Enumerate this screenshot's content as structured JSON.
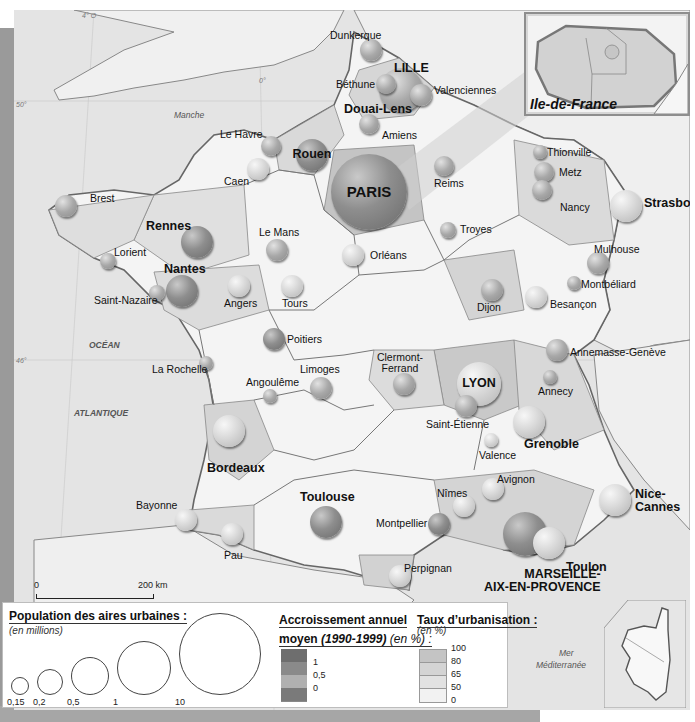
{
  "map": {
    "title": "Ile-de-France inset / France urban areas",
    "inset_idf_label": "Ile-de-France",
    "seas": [
      {
        "name": "Manche",
        "x": 160,
        "y": 100,
        "bold": false
      },
      {
        "name": "OCÉAN",
        "x": 75,
        "y": 330,
        "bold": true
      },
      {
        "name": "ATLANTIQUE",
        "x": 60,
        "y": 398,
        "bold": true
      },
      {
        "name": "Mer",
        "x": 545,
        "y": 638,
        "bold": false
      },
      {
        "name": "Méditerranée",
        "x": 522,
        "y": 650,
        "bold": false
      }
    ],
    "coordinates": [
      {
        "label": "4° O",
        "x": 68,
        "y": 2
      },
      {
        "label": "0°",
        "x": 245,
        "y": 67
      },
      {
        "label": "50°",
        "x": 2,
        "y": 91
      },
      {
        "label": "46°",
        "x": 2,
        "y": 347
      },
      {
        "label": "42°",
        "x": 600,
        "y": 640
      }
    ],
    "scale": {
      "start": "0",
      "end": "200 km"
    },
    "cities": [
      {
        "name": "PARIS",
        "x": 355,
        "y": 182,
        "r": 38,
        "tone": "dark",
        "big": true,
        "lx": 355,
        "ly": 176,
        "center": true,
        "inside": true
      },
      {
        "name": "LILLE",
        "x": 387,
        "y": 80,
        "r": 22,
        "tone": "mid",
        "big": true,
        "lx": 380,
        "ly": 52,
        "center": false
      },
      {
        "name": "Dunkerque",
        "x": 357,
        "y": 40,
        "r": 11,
        "tone": "mid",
        "big": false,
        "lx": 316,
        "ly": 20,
        "center": false
      },
      {
        "name": "Béthune",
        "x": 372,
        "y": 74,
        "r": 10,
        "tone": "mid",
        "big": false,
        "lx": 322,
        "ly": 69,
        "center": false
      },
      {
        "name": "Valenciennes",
        "x": 407,
        "y": 85,
        "r": 11,
        "tone": "mid",
        "big": false,
        "lx": 420,
        "ly": 75,
        "center": false
      },
      {
        "name": "Douai-Lens",
        "x": 365,
        "y": 90,
        "r": 0,
        "tone": "mid",
        "big": true,
        "lx": 330,
        "ly": 93,
        "center": false
      },
      {
        "name": "Amiens",
        "x": 355,
        "y": 114,
        "r": 10,
        "tone": "mid",
        "big": false,
        "lx": 368,
        "ly": 120,
        "center": false
      },
      {
        "name": "Le Havre",
        "x": 257,
        "y": 136,
        "r": 10,
        "tone": "mid",
        "big": false,
        "lx": 206,
        "ly": 119,
        "center": false
      },
      {
        "name": "Rouen",
        "x": 298,
        "y": 145,
        "r": 16,
        "tone": "dark",
        "big": true,
        "lx": 282,
        "ly": 137,
        "center": false,
        "inside": true
      },
      {
        "name": "Caen",
        "x": 244,
        "y": 159,
        "r": 11,
        "tone": "light",
        "big": false,
        "lx": 210,
        "ly": 166,
        "center": false
      },
      {
        "name": "Reims",
        "x": 430,
        "y": 156,
        "r": 10,
        "tone": "mid",
        "big": false,
        "lx": 420,
        "ly": 168,
        "center": false
      },
      {
        "name": "Thionville",
        "x": 526,
        "y": 142,
        "r": 7,
        "tone": "mid",
        "big": false,
        "lx": 533,
        "ly": 137,
        "center": false
      },
      {
        "name": "Metz",
        "x": 530,
        "y": 162,
        "r": 10,
        "tone": "mid",
        "big": false,
        "lx": 545,
        "ly": 157,
        "center": false
      },
      {
        "name": "Nancy",
        "x": 528,
        "y": 180,
        "r": 10,
        "tone": "mid",
        "big": false,
        "lx": 546,
        "ly": 192,
        "center": false
      },
      {
        "name": "Strasbourg",
        "x": 612,
        "y": 196,
        "r": 16,
        "tone": "light",
        "big": true,
        "lx": 630,
        "ly": 187,
        "center": false
      },
      {
        "name": "Brest",
        "x": 52,
        "y": 196,
        "r": 11,
        "tone": "mid",
        "big": false,
        "lx": 76,
        "ly": 183,
        "center": false
      },
      {
        "name": "Rennes",
        "x": 183,
        "y": 232,
        "r": 16,
        "tone": "dark",
        "big": true,
        "lx": 132,
        "ly": 210,
        "center": false
      },
      {
        "name": "Le Mans",
        "x": 263,
        "y": 240,
        "r": 11,
        "tone": "mid",
        "big": false,
        "lx": 245,
        "ly": 217,
        "center": false
      },
      {
        "name": "Orléans",
        "x": 339,
        "y": 245,
        "r": 11,
        "tone": "light",
        "big": false,
        "lx": 356,
        "ly": 240,
        "center": false
      },
      {
        "name": "Troyes",
        "x": 434,
        "y": 220,
        "r": 8,
        "tone": "mid",
        "big": false,
        "lx": 446,
        "ly": 214,
        "center": false
      },
      {
        "name": "Lorient",
        "x": 94,
        "y": 251,
        "r": 8,
        "tone": "mid",
        "big": false,
        "lx": 100,
        "ly": 237,
        "center": false
      },
      {
        "name": "Nantes",
        "x": 168,
        "y": 281,
        "r": 16,
        "tone": "dark",
        "big": true,
        "lx": 150,
        "ly": 253,
        "center": false
      },
      {
        "name": "Saint-Nazaire",
        "x": 143,
        "y": 283,
        "r": 8,
        "tone": "mid",
        "big": false,
        "lx": 80,
        "ly": 285,
        "center": false
      },
      {
        "name": "Angers",
        "x": 225,
        "y": 276,
        "r": 11,
        "tone": "light",
        "big": false,
        "lx": 210,
        "ly": 288,
        "center": false
      },
      {
        "name": "Tours",
        "x": 278,
        "y": 276,
        "r": 11,
        "tone": "light",
        "big": false,
        "lx": 268,
        "ly": 288,
        "center": false
      },
      {
        "name": "Mulhouse",
        "x": 584,
        "y": 253,
        "r": 11,
        "tone": "mid",
        "big": false,
        "lx": 580,
        "ly": 234,
        "center": false
      },
      {
        "name": "Montbéliard",
        "x": 560,
        "y": 273,
        "r": 7,
        "tone": "mid",
        "big": false,
        "lx": 567,
        "ly": 269,
        "center": false
      },
      {
        "name": "Dijon",
        "x": 478,
        "y": 280,
        "r": 11,
        "tone": "mid",
        "big": false,
        "lx": 463,
        "ly": 292,
        "center": false
      },
      {
        "name": "Besançon",
        "x": 522,
        "y": 287,
        "r": 11,
        "tone": "light",
        "big": false,
        "lx": 536,
        "ly": 289,
        "center": false
      },
      {
        "name": "Poitiers",
        "x": 260,
        "y": 329,
        "r": 11,
        "tone": "dark",
        "big": false,
        "lx": 273,
        "ly": 324,
        "center": false
      },
      {
        "name": "La Rochelle",
        "x": 192,
        "y": 353,
        "r": 7,
        "tone": "mid",
        "big": false,
        "lx": 138,
        "ly": 354,
        "center": false
      },
      {
        "name": "Limoges",
        "x": 307,
        "y": 378,
        "r": 11,
        "tone": "mid",
        "big": false,
        "lx": 286,
        "ly": 354,
        "center": false
      },
      {
        "name": "Angoulême",
        "x": 256,
        "y": 386,
        "r": 7,
        "tone": "mid",
        "big": false,
        "lx": 232,
        "ly": 367,
        "center": false
      },
      {
        "name": "Clermont-Ferrand",
        "x": 390,
        "y": 374,
        "r": 11,
        "tone": "mid",
        "big": false,
        "lx": 386,
        "ly": 342,
        "center": true
      },
      {
        "name": "LYON",
        "x": 465,
        "y": 374,
        "r": 22,
        "tone": "light",
        "big": true,
        "lx": 465,
        "ly": 367,
        "center": true,
        "inside": true
      },
      {
        "name": "Saint-Étienne",
        "x": 452,
        "y": 396,
        "r": 11,
        "tone": "mid",
        "big": false,
        "lx": 412,
        "ly": 409,
        "center": false
      },
      {
        "name": "Annemasse-Genève",
        "x": 543,
        "y": 340,
        "r": 11,
        "tone": "mid",
        "big": false,
        "lx": 556,
        "ly": 337,
        "center": false
      },
      {
        "name": "Annecy",
        "x": 536,
        "y": 367,
        "r": 7,
        "tone": "mid",
        "big": false,
        "lx": 524,
        "ly": 376,
        "center": false
      },
      {
        "name": "Grenoble",
        "x": 515,
        "y": 412,
        "r": 16,
        "tone": "light",
        "big": true,
        "lx": 510,
        "ly": 428,
        "center": false
      },
      {
        "name": "Valence",
        "x": 477,
        "y": 430,
        "r": 7,
        "tone": "light",
        "big": false,
        "lx": 465,
        "ly": 440,
        "center": false
      },
      {
        "name": "Bordeaux",
        "x": 215,
        "y": 421,
        "r": 16,
        "tone": "light",
        "big": true,
        "lx": 193,
        "ly": 452,
        "center": false
      },
      {
        "name": "Avignon",
        "x": 479,
        "y": 479,
        "r": 11,
        "tone": "light",
        "big": false,
        "lx": 483,
        "ly": 464,
        "center": false
      },
      {
        "name": "Nîmes",
        "x": 450,
        "y": 496,
        "r": 11,
        "tone": "light",
        "big": false,
        "lx": 423,
        "ly": 478,
        "center": false
      },
      {
        "name": "Montpellier",
        "x": 425,
        "y": 514,
        "r": 11,
        "tone": "dark",
        "big": false,
        "lx": 362,
        "ly": 508,
        "center": false
      },
      {
        "name": "Nice-Cannes",
        "x": 601,
        "y": 490,
        "r": 16,
        "tone": "light",
        "big": true,
        "lx": 621,
        "ly": 478,
        "center": false
      },
      {
        "name": "Toulouse",
        "x": 312,
        "y": 512,
        "r": 16,
        "tone": "dark",
        "big": true,
        "lx": 286,
        "ly": 481,
        "center": false
      },
      {
        "name": "Bayonne",
        "x": 172,
        "y": 510,
        "r": 11,
        "tone": "light",
        "big": false,
        "lx": 122,
        "ly": 490,
        "center": false
      },
      {
        "name": "Pau",
        "x": 218,
        "y": 524,
        "r": 11,
        "tone": "light",
        "big": false,
        "lx": 210,
        "ly": 540,
        "center": false
      },
      {
        "name": "MARSEILLE-AIX-EN-PROVENCE",
        "x": 511,
        "y": 524,
        "r": 22,
        "tone": "dark",
        "big": true,
        "lx": 470,
        "ly": 558,
        "center": false
      },
      {
        "name": "Toulon",
        "x": 535,
        "y": 533,
        "r": 16,
        "tone": "light",
        "big": true,
        "lx": 552,
        "ly": 551,
        "center": false
      },
      {
        "name": "Perpignan",
        "x": 386,
        "y": 566,
        "r": 11,
        "tone": "light",
        "big": false,
        "lx": 390,
        "ly": 553,
        "center": false
      }
    ]
  },
  "legend": {
    "population": {
      "title": "Population des aires urbaines :",
      "subtitle": "(en millions)",
      "sizes": [
        {
          "label": "0,15",
          "d": 16
        },
        {
          "label": "0,2",
          "d": 24
        },
        {
          "label": "0,5",
          "d": 36
        },
        {
          "label": "1",
          "d": 52
        },
        {
          "label": "10",
          "d": 80
        }
      ]
    },
    "growth": {
      "title_line1": "Accroissement annuel",
      "title_line2_a": "moyen ",
      "title_line2_b": "(1990-1999)",
      "title_line2_c": " (en %) :",
      "breaks": [
        "1",
        "0,5",
        "0"
      ],
      "colors": [
        "#6e6e6e",
        "#8a8a8a",
        "#b0b0b0",
        "#7a7a7a"
      ]
    },
    "urbanisation": {
      "title": "Taux d’urbanisation :",
      "subtitle": "(en %)",
      "breaks": [
        "100",
        "80",
        "65",
        "50",
        "0"
      ],
      "colors": [
        "#c4c4c4",
        "#d4d4d4",
        "#e2e2e2",
        "#f2f2f2"
      ]
    }
  },
  "colors": {
    "sea": "#e4e4e4",
    "land_light": "#f4f4f4",
    "land_mid": "#d8d8d8",
    "land_dark": "#bdbdbd",
    "border": "#777777",
    "frame": "#9a9a9a"
  }
}
